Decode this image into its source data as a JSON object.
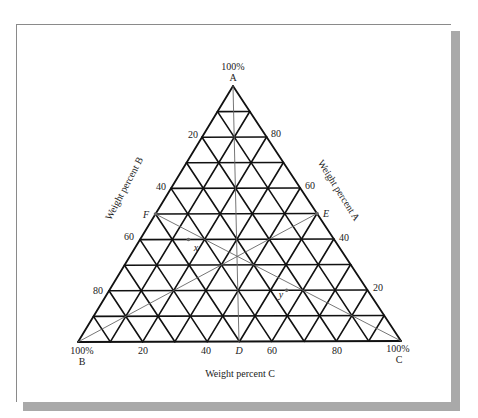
{
  "chart_data": {
    "type": "ternary",
    "title": "",
    "vertices": {
      "A": {
        "label": "A",
        "value_label": "100%"
      },
      "B": {
        "label": "B",
        "value_label": "100%"
      },
      "C": {
        "label": "C",
        "value_label": "100%"
      }
    },
    "axes": {
      "A": {
        "label": "Weight percent A",
        "ticks": [
          "80",
          "60",
          "40",
          "20"
        ]
      },
      "B": {
        "label": "Weight percent B",
        "ticks": [
          "20",
          "40",
          "60",
          "80"
        ]
      },
      "C": {
        "label": "Weight percent C",
        "ticks": [
          "20",
          "40",
          "60",
          "80"
        ]
      }
    },
    "grid": {
      "divisions": 10,
      "step_percent": 10
    },
    "points": [
      {
        "name": "D",
        "A": 0,
        "B": 50,
        "C": 50
      },
      {
        "name": "E",
        "A": 50,
        "B": 0,
        "C": 50
      },
      {
        "name": "F",
        "A": 50,
        "B": 50,
        "C": 0
      },
      {
        "name": "x",
        "A": 40,
        "B": 45,
        "C": 15
      },
      {
        "name": "y",
        "A": 20,
        "B": 25,
        "C": 55
      }
    ],
    "lines": [
      {
        "from": "A",
        "to": "D"
      },
      {
        "from": "E",
        "to": "B"
      },
      {
        "from": "F",
        "to": "C"
      }
    ]
  },
  "labels": {
    "top_pct": "100%",
    "top_name": "A",
    "left_pct": "100%",
    "left_name": "B",
    "right_pct": "100%",
    "right_name": "C",
    "axis_a": "Weight percent A",
    "axis_b": "Weight percent B",
    "axis_c": "Weight percent C",
    "b_ticks": [
      "20",
      "40",
      "60",
      "80"
    ],
    "a_ticks": [
      "80",
      "60",
      "40",
      "20"
    ],
    "c_ticks": [
      "20",
      "40",
      "60",
      "80"
    ],
    "point_d": "D",
    "point_e": "E",
    "point_f": "F",
    "point_x": "x",
    "point_y": "y"
  }
}
